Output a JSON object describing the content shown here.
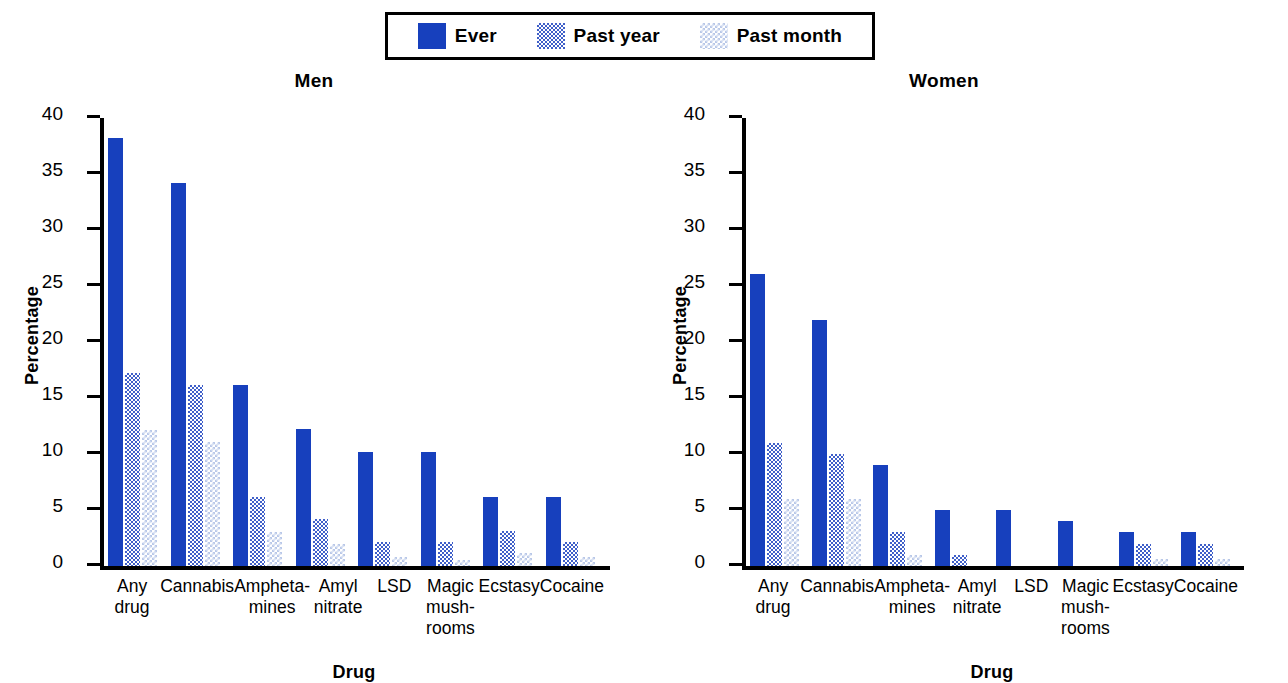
{
  "legend": {
    "entries": [
      {
        "label": "Ever",
        "swatch": "solid-blue-swatch",
        "color": "#1740bd"
      },
      {
        "label": "Past year",
        "swatch": "dithered-medium-blue-swatch",
        "color": "#3f5fc9"
      },
      {
        "label": "Past month",
        "swatch": "dithered-light-blue-swatch",
        "color": "#b9c8e8"
      }
    ]
  },
  "panels": [
    {
      "title": "Men"
    },
    {
      "title": "Women"
    }
  ],
  "axis": {
    "ylabel": "Percentage",
    "xlabel": "Drug",
    "ticks": [
      "40",
      "35",
      "30",
      "25",
      "20",
      "15",
      "10",
      "5",
      "0"
    ]
  },
  "categories": [
    {
      "l1": "Any drug",
      "l2": "",
      "l3": ""
    },
    {
      "l1": "Cannabis",
      "l2": "",
      "l3": ""
    },
    {
      "l1": "Ampheta-",
      "l2": "mines",
      "l3": ""
    },
    {
      "l1": "Amyl",
      "l2": "nitrate",
      "l3": ""
    },
    {
      "l1": "LSD",
      "l2": "",
      "l3": ""
    },
    {
      "l1": "Magic",
      "l2": "mush-",
      "l3": "rooms"
    },
    {
      "l1": "Ecstasy",
      "l2": "",
      "l3": ""
    },
    {
      "l1": "Cocaine",
      "l2": "",
      "l3": ""
    }
  ],
  "chart_data": [
    {
      "type": "bar",
      "title": "Men",
      "xlabel": "Drug",
      "ylabel": "Percentage",
      "ylim": [
        0,
        40
      ],
      "yticks": [
        0,
        5,
        10,
        15,
        20,
        25,
        30,
        35,
        40
      ],
      "grid": false,
      "legend_position": "top-center",
      "categories": [
        "Any drug",
        "Cannabis",
        "Amphetamines",
        "Amyl nitrate",
        "LSD",
        "Magic mushrooms",
        "Ecstasy",
        "Cocaine"
      ],
      "series": [
        {
          "name": "Ever",
          "values": [
            38.2,
            34.2,
            16.2,
            12.2,
            10.2,
            10.2,
            6.2,
            6.2
          ]
        },
        {
          "name": "Past year",
          "values": [
            17.2,
            16.2,
            6.2,
            4.2,
            2.1,
            2.1,
            3.1,
            2.1
          ]
        },
        {
          "name": "Past month",
          "values": [
            12.1,
            11.1,
            3.0,
            2.0,
            0.8,
            0.5,
            1.2,
            0.8
          ]
        }
      ]
    },
    {
      "type": "bar",
      "title": "Women",
      "xlabel": "Drug",
      "ylabel": "Percentage",
      "ylim": [
        0,
        40
      ],
      "yticks": [
        0,
        5,
        10,
        15,
        20,
        25,
        30,
        35,
        40
      ],
      "grid": false,
      "legend_position": "top-center",
      "categories": [
        "Any drug",
        "Cannabis",
        "Amphetamines",
        "Amyl nitrate",
        "LSD",
        "Magic mushrooms",
        "Ecstasy",
        "Cocaine"
      ],
      "series": [
        {
          "name": "Ever",
          "values": [
            26.1,
            22.0,
            9.0,
            5.0,
            5.0,
            4.0,
            3.0,
            3.0
          ]
        },
        {
          "name": "Past year",
          "values": [
            11.0,
            10.0,
            3.0,
            1.0,
            0.0,
            0.0,
            2.0,
            2.0
          ]
        },
        {
          "name": "Past month",
          "values": [
            6.0,
            6.0,
            1.0,
            0.0,
            0.0,
            0.0,
            0.6,
            0.6
          ]
        }
      ]
    }
  ]
}
